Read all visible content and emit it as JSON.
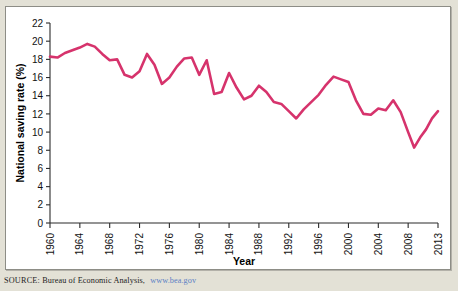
{
  "figure": {
    "background_color": "#e3e1d6",
    "panel_color": "#ffffff",
    "line_color": "#d6336c"
  },
  "source": {
    "label": "SOURCE:",
    "text": "Bureau of Economic Analysis,",
    "url": "www.bea.gov"
  },
  "chart_data": {
    "type": "line",
    "title": "",
    "xlabel": "Year",
    "ylabel": "National saving rate (%)",
    "xlim": [
      1960,
      2013
    ],
    "ylim": [
      0,
      22
    ],
    "grid": false,
    "legend": "none",
    "ytick_labels": [
      "0",
      "2",
      "4",
      "6",
      "8",
      "10",
      "12",
      "14",
      "16",
      "18",
      "20",
      "22"
    ],
    "yticks": [
      0,
      2,
      4,
      6,
      8,
      10,
      12,
      14,
      16,
      18,
      20,
      22
    ],
    "xtick_labels": [
      "1960",
      "1964",
      "1968",
      "1972",
      "1976",
      "1980",
      "1984",
      "1988",
      "1992",
      "1996",
      "2000",
      "2004",
      "2008",
      "2013"
    ],
    "xticks": [
      1960,
      1964,
      1968,
      1972,
      1976,
      1980,
      1984,
      1988,
      1992,
      1996,
      2000,
      2004,
      2008,
      2013
    ],
    "series": [
      {
        "name": "National saving rate",
        "color": "#d6336c",
        "x": [
          1960,
          1961,
          1962,
          1963,
          1964,
          1965,
          1966,
          1967,
          1968,
          1969,
          1970,
          1971,
          1972,
          1973,
          1974,
          1975,
          1976,
          1977,
          1978,
          1979,
          1980,
          1981,
          1982,
          1983,
          1984,
          1985,
          1986,
          1987,
          1988,
          1989,
          1990,
          1991,
          1992,
          1993,
          1994,
          1995,
          1996,
          1997,
          1998,
          1999,
          2000,
          2001,
          2002,
          2003,
          2004,
          2005,
          2006,
          2007,
          2008,
          2009,
          2010,
          2011,
          2012,
          2013
        ],
        "values": [
          18.3,
          18.2,
          18.7,
          19.0,
          19.3,
          19.7,
          19.4,
          18.6,
          17.9,
          18.0,
          16.3,
          16.0,
          16.7,
          18.6,
          17.4,
          15.3,
          16.0,
          17.2,
          18.1,
          18.2,
          16.3,
          17.9,
          14.2,
          14.4,
          16.5,
          14.9,
          13.6,
          14.0,
          15.1,
          14.4,
          13.3,
          13.1,
          12.3,
          11.5,
          12.5,
          13.3,
          14.1,
          15.2,
          16.1,
          15.8,
          15.5,
          13.5,
          12.0,
          11.9,
          12.6,
          12.4,
          13.5,
          12.2,
          10.0,
          8.3,
          9.4,
          10.3,
          11.5,
          12.3
        ]
      }
    ]
  }
}
